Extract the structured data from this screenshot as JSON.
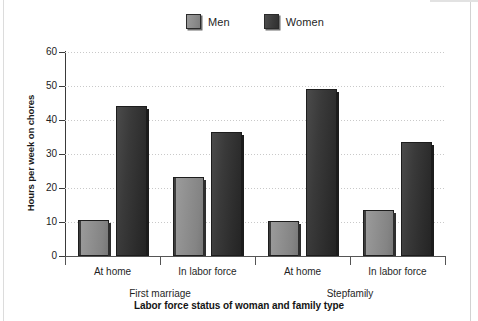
{
  "chart_data": {
    "type": "bar",
    "title": "",
    "xlabel": "Labor force status of woman and family type",
    "ylabel": "Hours per week on chores",
    "categories": [
      "At home",
      "In labor force",
      "At home",
      "In labor force"
    ],
    "groups": [
      {
        "label": "First marriage",
        "categories": [
          "At home",
          "In labor force"
        ]
      },
      {
        "label": "Stepfamily",
        "categories": [
          "At home",
          "In labor force"
        ]
      }
    ],
    "series": [
      {
        "name": "Men",
        "color": "#8c8c8c",
        "values": [
          10.5,
          23.2,
          10.3,
          13.5
        ]
      },
      {
        "name": "Women",
        "color": "#343434",
        "values": [
          44.2,
          36.5,
          49.2,
          33.5
        ]
      }
    ],
    "ylim": [
      0,
      60
    ],
    "ytick_values": [
      0,
      10,
      20,
      30,
      40,
      50,
      60
    ],
    "ytick_labels": [
      "0",
      "10",
      "20",
      "30",
      "40",
      "50",
      "60"
    ],
    "grid": true,
    "legend_position": "top-center"
  },
  "legend": {
    "items": [
      {
        "label": "Men",
        "swatch": "men-swatch-icon"
      },
      {
        "label": "Women",
        "swatch": "women-swatch-icon"
      }
    ]
  }
}
